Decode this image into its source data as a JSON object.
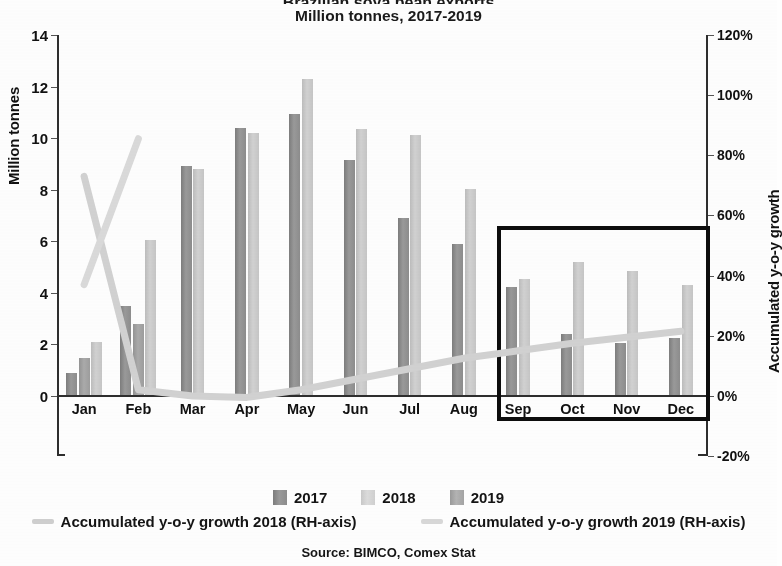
{
  "header": {
    "title": "Brazilian soya bean exports",
    "subtitle": "Million tonnes, 2017-2019"
  },
  "source_note": "Source: BIMCO, Comex Stat",
  "axes": {
    "left_title": "Million tonnes",
    "right_title": "Accumulated y-o-y growth",
    "left_ticks": [
      "0",
      "2",
      "4",
      "6",
      "8",
      "10",
      "12",
      "14"
    ],
    "right_ticks": [
      "-20%",
      "0%",
      "20%",
      "40%",
      "60%",
      "80%",
      "100%",
      "120%"
    ]
  },
  "legend": {
    "bars": [
      {
        "label": "2017",
        "color": "#8d8d8d"
      },
      {
        "label": "2018",
        "color": "#d0d0d0"
      },
      {
        "label": "2019",
        "color": "#a4a4a4"
      }
    ],
    "lines": [
      {
        "label": "Accumulated y-o-y growth 2018 (RH-axis)",
        "color": "#cfcfcf"
      },
      {
        "label": "Accumulated y-o-y growth 2019 (RH-axis)",
        "color": "#d8d8d8"
      }
    ]
  },
  "annotation": {
    "highlight_box_label": "Sep-Dec highlight box",
    "color": "#0d0d0d",
    "covers_months": [
      "Sep",
      "Oct",
      "Nov",
      "Dec"
    ]
  },
  "chart_data": {
    "type": "bar",
    "title": "Brazilian soya bean exports",
    "subtitle": "Million tonnes, 2017-2019",
    "categories": [
      "Jan",
      "Feb",
      "Mar",
      "Apr",
      "May",
      "Jun",
      "Jul",
      "Aug",
      "Sep",
      "Oct",
      "Nov",
      "Dec"
    ],
    "xlabel": "",
    "ylabel": "Million tonnes",
    "ylim": [
      0,
      14
    ],
    "y2label": "Accumulated y-o-y growth",
    "y2lim": [
      -0.2,
      1.2
    ],
    "grid": false,
    "legend_position": "bottom",
    "series": [
      {
        "name": "2017",
        "type": "bar",
        "axis": "left",
        "values": [
          0.85,
          3.45,
          8.9,
          10.35,
          10.9,
          9.1,
          6.85,
          5.85,
          4.2,
          2.35,
          2.0,
          2.2
        ]
      },
      {
        "name": "2018",
        "type": "bar",
        "axis": "left",
        "values": [
          2.05,
          6.0,
          8.75,
          10.15,
          12.25,
          10.3,
          10.1,
          8.0,
          4.5,
          5.15,
          4.8,
          4.25
        ]
      },
      {
        "name": "2019",
        "type": "bar",
        "axis": "left",
        "values": [
          1.45,
          2.75,
          null,
          null,
          null,
          null,
          null,
          null,
          null,
          null,
          null,
          null
        ]
      },
      {
        "name": "Accumulated y-o-y growth 2018 (RH-axis)",
        "type": "line",
        "axis": "right",
        "values": [
          0.73,
          0.02,
          0.0,
          -0.005,
          0.02,
          0.055,
          0.09,
          0.125,
          0.15,
          0.175,
          0.195,
          0.215
        ]
      },
      {
        "name": "Accumulated y-o-y growth 2019 (RH-axis)",
        "type": "line",
        "axis": "right",
        "values": [
          0.37,
          0.855,
          null,
          null,
          null,
          null,
          null,
          null,
          null,
          null,
          null,
          null
        ]
      }
    ]
  }
}
